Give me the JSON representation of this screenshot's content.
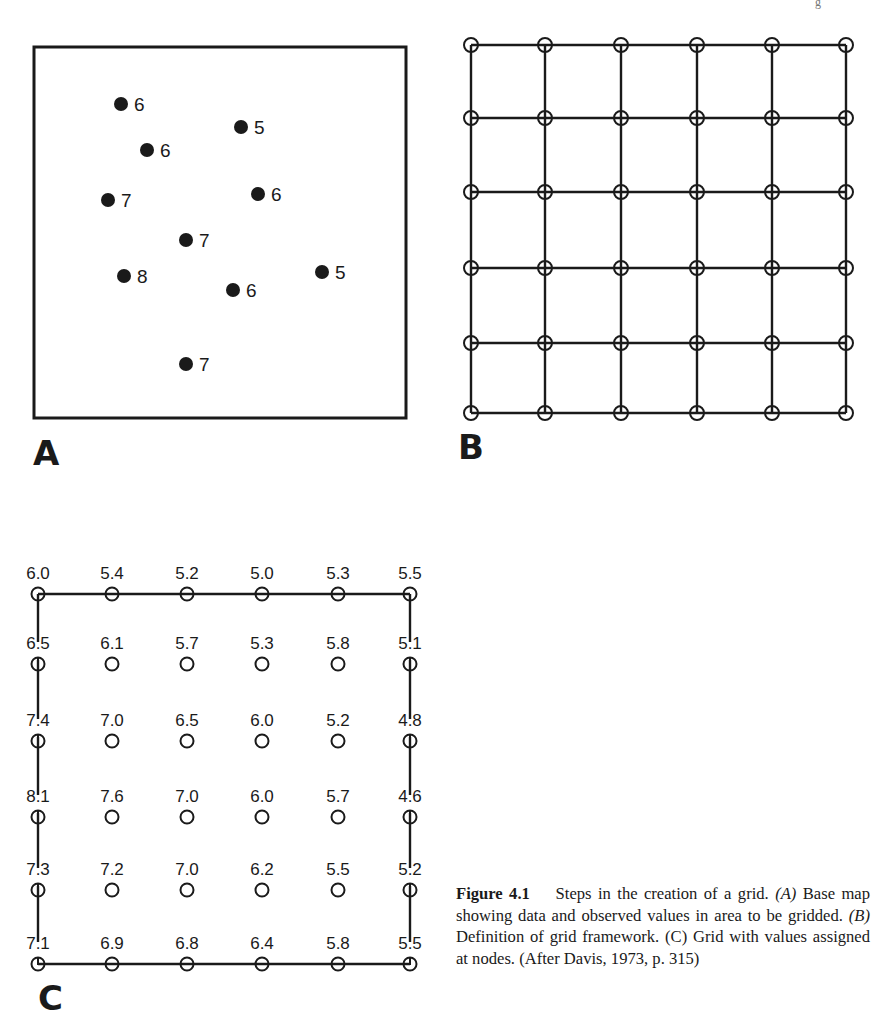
{
  "header": {
    "partial_glyph": "g"
  },
  "panel_a": {
    "label": "A",
    "box": {
      "x": 34,
      "y": 47,
      "w": 372,
      "h": 371
    },
    "points": [
      {
        "x": 121,
        "y": 104,
        "value": "6"
      },
      {
        "x": 241,
        "y": 127,
        "value": "5"
      },
      {
        "x": 147,
        "y": 150,
        "value": "6"
      },
      {
        "x": 108,
        "y": 200,
        "value": "7"
      },
      {
        "x": 258,
        "y": 194,
        "value": "6"
      },
      {
        "x": 186,
        "y": 240,
        "value": "7"
      },
      {
        "x": 124,
        "y": 276,
        "value": "8"
      },
      {
        "x": 233,
        "y": 290,
        "value": "6"
      },
      {
        "x": 322,
        "y": 272,
        "value": "5"
      },
      {
        "x": 186,
        "y": 364,
        "value": "7"
      }
    ]
  },
  "panel_b": {
    "label": "B",
    "cols_x": [
      471,
      545,
      621,
      697,
      772,
      846
    ],
    "rows_y": [
      45,
      118,
      192,
      268,
      343,
      413
    ]
  },
  "panel_c": {
    "label": "C",
    "cols_x": [
      38,
      112,
      187,
      262,
      338,
      410
    ],
    "rows_y": [
      594,
      664,
      741,
      817,
      890,
      964
    ],
    "values": [
      [
        "6.0",
        "5.4",
        "5.2",
        "5.0",
        "5.3",
        "5.5"
      ],
      [
        "6.5",
        "6.1",
        "5.7",
        "5.3",
        "5.8",
        "5.1"
      ],
      [
        "7.4",
        "7.0",
        "6.5",
        "6.0",
        "5.2",
        "4.8"
      ],
      [
        "8.1",
        "7.6",
        "7.0",
        "6.0",
        "5.7",
        "4.6"
      ],
      [
        "7.3",
        "7.2",
        "7.0",
        "6.2",
        "5.5",
        "5.2"
      ],
      [
        "7.1",
        "6.9",
        "6.8",
        "6.4",
        "5.8",
        "5.5"
      ]
    ]
  },
  "caption": {
    "figure_number": "Figure 4.1",
    "title": "Steps in the creation of a grid.",
    "part_a_tag": "(A)",
    "part_a_text": "Base map showing data and observed values in area to be gridded.",
    "part_b_tag": "(B)",
    "part_b_text": "Definition of grid framework.",
    "part_c_tag": "(C)",
    "part_c_text": "Grid with values assigned at nodes.",
    "source": "(After Davis, 1973, p. 315)"
  }
}
